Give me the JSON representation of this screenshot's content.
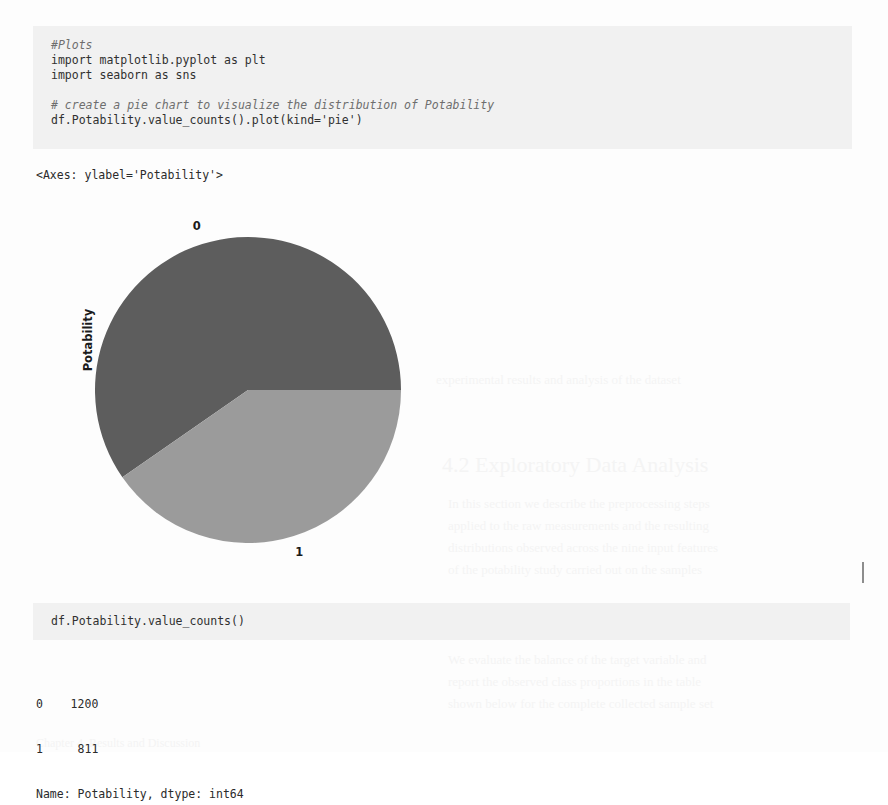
{
  "document": {
    "kind": "jupyter-notebook-scan",
    "background_color": "#fdfdfd"
  },
  "cell_1": {
    "name": "plots-code-cell",
    "background_color": "#f1f1f1",
    "lines": [
      {
        "text": "#Plots",
        "style": "comment"
      },
      {
        "text": "import matplotlib.pyplot as plt",
        "style": "code"
      },
      {
        "text": "import seaborn as sns",
        "style": "code"
      },
      {
        "text": "",
        "style": "blank"
      },
      {
        "text": "# create a pie chart to visualize the distribution of Potability",
        "style": "comment"
      },
      {
        "text": "df.Potability.value_counts().plot(kind='pie')",
        "style": "code"
      }
    ]
  },
  "output_1": {
    "name": "axes-repr",
    "text": "<Axes: ylabel='Potability'>"
  },
  "chart_data": {
    "type": "pie",
    "title": "",
    "xlabel": "",
    "ylabel": "Potability",
    "categories": [
      "0",
      "1"
    ],
    "values": [
      1200,
      811
    ],
    "total": 2011,
    "percentages": [
      59.7,
      40.3
    ],
    "start_angle_deg": 0,
    "direction": "counterclockwise",
    "slice_colors": [
      "#5d5d5d",
      "#9b9b9b"
    ],
    "slice_labels": [
      "0",
      "1"
    ],
    "legend": "none",
    "grid": false,
    "label_color": "#1b1b1b"
  },
  "cell_2": {
    "name": "value-counts-code-cell",
    "background_color": "#f1f1f1",
    "lines": [
      {
        "text": "df.Potability.value_counts()",
        "style": "code"
      }
    ]
  },
  "output_2": {
    "name": "value-counts-output",
    "lines": [
      "0    1200",
      "1     811",
      "Name: Potability, dtype: int64"
    ]
  },
  "ghost_text": {
    "note": "faint bleed-through from reverse side of scanned page",
    "color": "#f4f4f4",
    "lines": [
      {
        "text": "experimental results and analysis of the dataset",
        "x": 436,
        "y": 372,
        "size": 13
      },
      {
        "text": "4.2  Exploratory Data Analysis",
        "x": 442,
        "y": 452,
        "size": 22
      },
      {
        "text": "In this section we describe the preprocessing steps",
        "x": 448,
        "y": 496,
        "size": 13
      },
      {
        "text": "applied to the raw measurements and the resulting",
        "x": 448,
        "y": 518,
        "size": 13
      },
      {
        "text": "distributions observed across the nine input features",
        "x": 448,
        "y": 540,
        "size": 13
      },
      {
        "text": "of the potability study carried out on the samples",
        "x": 448,
        "y": 562,
        "size": 13
      },
      {
        "text": "We evaluate the balance of the target variable and",
        "x": 448,
        "y": 652,
        "size": 13
      },
      {
        "text": "report the observed class proportions in the table",
        "x": 448,
        "y": 674,
        "size": 13
      },
      {
        "text": "shown below for the complete collected sample set",
        "x": 448,
        "y": 696,
        "size": 13
      },
      {
        "text": "Chapter 4. Results and Discussion",
        "x": 36,
        "y": 736,
        "size": 12
      }
    ]
  }
}
